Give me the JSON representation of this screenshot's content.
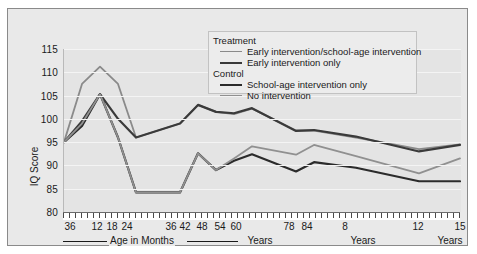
{
  "chart_data": {
    "type": "line",
    "title": "",
    "xlabel": "Age in Months",
    "ylabel": "IQ Score",
    "ylim": [
      80,
      115
    ],
    "yticks": [
      80,
      85,
      90,
      95,
      100,
      105,
      110,
      115
    ],
    "grid": true,
    "legend_position": "top-right",
    "x_tick_labels": [
      "36",
      "12",
      "18",
      "24",
      "36",
      "42",
      "48",
      "54",
      "60",
      "78",
      "84",
      "8",
      "12",
      "15"
    ],
    "x_group_labels": [
      "Age in Months",
      "Years",
      "Years",
      "Years"
    ],
    "x_values_months": [
      3,
      6,
      12,
      18,
      24,
      36,
      42,
      48,
      54,
      60,
      78,
      84,
      96,
      144,
      180
    ],
    "series": [
      {
        "name": "Early intervention/school-age intervention",
        "group": "Treatment",
        "color": "#8a8a8a",
        "width": 1.8,
        "values": [
          95.0,
          107.5,
          111.2,
          107.5,
          96.0,
          99.0,
          103.0,
          101.5,
          101.0,
          102.2,
          97.5,
          97.5,
          96.0,
          93.5,
          94.5
        ]
      },
      {
        "name": "Early intervention only",
        "group": "Treatment",
        "color": "#3a3a3a",
        "width": 2.2,
        "values": [
          95.0,
          99.5,
          105.3,
          100.0,
          96.0,
          99.0,
          103.0,
          101.5,
          101.2,
          102.3,
          97.4,
          97.6,
          96.2,
          93.0,
          94.4
        ]
      },
      {
        "name": "School-age intervention only",
        "group": "Control",
        "color": "#2b2b2b",
        "width": 2.2,
        "values": [
          95.0,
          98.5,
          105.3,
          96.0,
          84.2,
          84.2,
          92.6,
          89.0,
          91.0,
          92.4,
          88.7,
          90.7,
          89.5,
          86.6,
          86.6
        ]
      },
      {
        "name": "No intervention",
        "group": "Control",
        "color": "#909090",
        "width": 1.8,
        "values": [
          95.0,
          99.0,
          105.3,
          96.0,
          84.2,
          84.2,
          92.6,
          89.0,
          91.5,
          94.1,
          92.3,
          94.4,
          92.0,
          88.3,
          91.5
        ]
      }
    ]
  },
  "legend": {
    "groups": [
      {
        "header": "Treatment",
        "entries": [
          {
            "label": "Early intervention/school-age intervention",
            "color": "#8a8a8a",
            "thickness": "1.8px"
          },
          {
            "label": "Early intervention only",
            "color": "#3a3a3a",
            "thickness": "2.6px"
          }
        ]
      },
      {
        "header": "Control",
        "entries": [
          {
            "label": "School-age intervention only",
            "color": "#2b2b2b",
            "thickness": "2.6px"
          },
          {
            "label": "No intervention",
            "color": "#909090",
            "thickness": "1.8px"
          }
        ]
      }
    ]
  },
  "axes": {
    "y_title": "IQ Score",
    "x_groups": [
      {
        "label": "Age in Months",
        "kind": "months-rule"
      },
      {
        "label": "Years",
        "x": 252
      },
      {
        "label": "Years",
        "x": 355
      },
      {
        "label": "Years",
        "x": 442
      }
    ]
  }
}
